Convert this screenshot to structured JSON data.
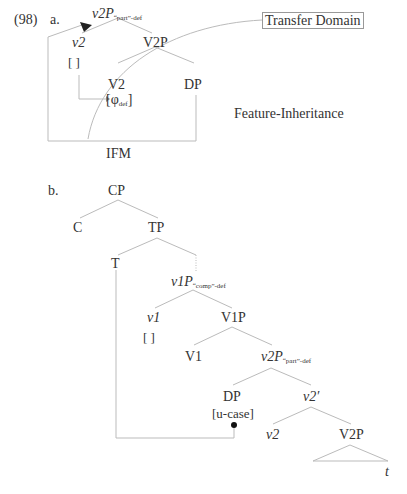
{
  "example_number": "(98)",
  "part_a": {
    "label": "a.",
    "root": {
      "main": "v2P",
      "sub": "“part”-def"
    },
    "v2": "v2",
    "v2_bracket": "[    ]",
    "v2p": "V2P",
    "V2": "V2",
    "DP": "DP",
    "phi": {
      "main": "[φ",
      "sub": "def",
      "close": "]"
    },
    "transfer_domain": "Transfer Domain",
    "feature_inheritance": "Feature-Inheritance",
    "ifm": "IFM"
  },
  "part_b": {
    "label": "b.",
    "CP": "CP",
    "C": "C",
    "TP": "TP",
    "T": "T",
    "v1P": {
      "main": "v1P",
      "sub": "“comp”-def"
    },
    "v1": "v1",
    "v1_bracket": "[    ]",
    "V1P": "V1P",
    "V1": "V1",
    "v2P": {
      "main": "v2P",
      "sub": "“part”-def"
    },
    "DP": "DP",
    "u_case": "[u-case]",
    "v2bar": "v2′",
    "v2": "v2",
    "V2P": "V2P",
    "t": "t"
  },
  "colors": {
    "line": "#bbbbbb",
    "text": "#333333",
    "dot": "#111111"
  }
}
